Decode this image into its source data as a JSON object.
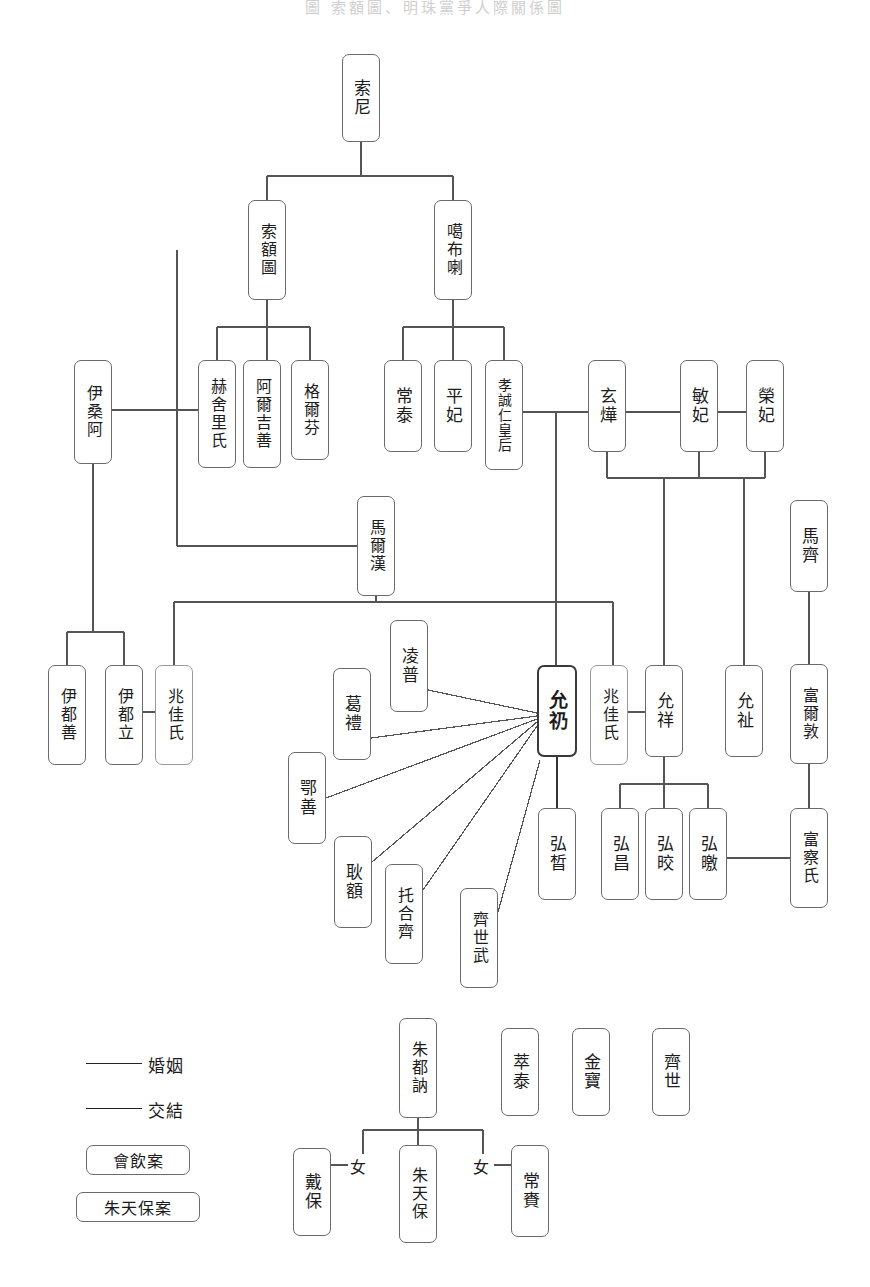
{
  "title": "圖  索額圖、明珠黨爭人際關係圖",
  "legend": {
    "lines": [
      {
        "key": "marriage",
        "label": "婚姻"
      },
      {
        "key": "association",
        "label": "交結"
      }
    ],
    "boxes": [
      {
        "key": "case-drinking",
        "label": "會飲案"
      },
      {
        "key": "case-zhutianbao",
        "label": "朱天保案"
      }
    ]
  },
  "relation_labels": {
    "daughter_left": "女",
    "daughter_right": "女"
  },
  "nodes": [
    {
      "id": "suoni",
      "label": "索尼",
      "x": 342,
      "y": 54,
      "w": 38,
      "h": 88,
      "style": "normal",
      "chars": 2
    },
    {
      "id": "suo-e-tu",
      "label": "索額圖",
      "x": 248,
      "y": 200,
      "w": 38,
      "h": 100,
      "style": "normal",
      "chars": 3
    },
    {
      "id": "gabula",
      "label": "噶布喇",
      "x": 434,
      "y": 200,
      "w": 38,
      "h": 100,
      "style": "normal",
      "chars": 3
    },
    {
      "id": "yisang-a",
      "label": "伊桑阿",
      "x": 74,
      "y": 360,
      "w": 38,
      "h": 104,
      "style": "normal",
      "chars": 3
    },
    {
      "id": "heshelishi",
      "label": "赫舍里氏",
      "x": 198,
      "y": 360,
      "w": 38,
      "h": 108,
      "style": "normal",
      "chars": 4
    },
    {
      "id": "aerjishan",
      "label": "阿爾吉善",
      "x": 243,
      "y": 360,
      "w": 38,
      "h": 108,
      "style": "normal",
      "chars": 4
    },
    {
      "id": "gerfen",
      "label": "格爾芬",
      "x": 291,
      "y": 360,
      "w": 38,
      "h": 100,
      "style": "normal",
      "chars": 3
    },
    {
      "id": "changtai",
      "label": "常泰",
      "x": 384,
      "y": 360,
      "w": 38,
      "h": 92,
      "style": "normal",
      "chars": 2
    },
    {
      "id": "pingfei",
      "label": "平妃",
      "x": 434,
      "y": 360,
      "w": 38,
      "h": 92,
      "style": "normal",
      "chars": 2
    },
    {
      "id": "xiaochengren",
      "label": "孝誠仁皇后",
      "x": 485,
      "y": 360,
      "w": 38,
      "h": 110,
      "style": "normal",
      "chars": 5
    },
    {
      "id": "xuanye",
      "label": "玄燁",
      "x": 588,
      "y": 360,
      "w": 38,
      "h": 92,
      "style": "normal",
      "chars": 2
    },
    {
      "id": "minfei",
      "label": "敏妃",
      "x": 680,
      "y": 360,
      "w": 38,
      "h": 92,
      "style": "normal",
      "chars": 2
    },
    {
      "id": "rongfei",
      "label": "榮妃",
      "x": 746,
      "y": 360,
      "w": 38,
      "h": 92,
      "style": "normal",
      "chars": 2
    },
    {
      "id": "maerhan",
      "label": "馬爾漢",
      "x": 357,
      "y": 496,
      "w": 38,
      "h": 100,
      "style": "normal",
      "chars": 3
    },
    {
      "id": "maqi",
      "label": "馬齊",
      "x": 790,
      "y": 500,
      "w": 38,
      "h": 92,
      "style": "normal",
      "chars": 2
    },
    {
      "id": "yidushan",
      "label": "伊都善",
      "x": 48,
      "y": 665,
      "w": 38,
      "h": 100,
      "style": "normal",
      "chars": 3
    },
    {
      "id": "yiduli",
      "label": "伊都立",
      "x": 105,
      "y": 665,
      "w": 38,
      "h": 100,
      "style": "normal",
      "chars": 3
    },
    {
      "id": "zhaojia-left",
      "label": "兆佳氏",
      "x": 155,
      "y": 665,
      "w": 38,
      "h": 100,
      "style": "light",
      "chars": 3
    },
    {
      "id": "lingpu",
      "label": "凌普",
      "x": 390,
      "y": 620,
      "w": 38,
      "h": 92,
      "style": "normal",
      "chars": 2
    },
    {
      "id": "geli",
      "label": "葛禮",
      "x": 333,
      "y": 668,
      "w": 38,
      "h": 92,
      "style": "normal",
      "chars": 2
    },
    {
      "id": "eshan",
      "label": "鄂善",
      "x": 288,
      "y": 752,
      "w": 38,
      "h": 92,
      "style": "normal",
      "chars": 2
    },
    {
      "id": "gen-e",
      "label": "耿額",
      "x": 334,
      "y": 836,
      "w": 38,
      "h": 92,
      "style": "normal",
      "chars": 2
    },
    {
      "id": "tuheqi",
      "label": "托合齊",
      "x": 385,
      "y": 864,
      "w": 38,
      "h": 100,
      "style": "normal",
      "chars": 3
    },
    {
      "id": "qishiwu",
      "label": "齊世武",
      "x": 460,
      "y": 888,
      "w": 38,
      "h": 100,
      "style": "normal",
      "chars": 3
    },
    {
      "id": "yunreng",
      "label": "允礽",
      "x": 537,
      "y": 665,
      "w": 40,
      "h": 92,
      "style": "bold",
      "chars": 2
    },
    {
      "id": "zhaojia-mid",
      "label": "兆佳氏",
      "x": 590,
      "y": 665,
      "w": 38,
      "h": 100,
      "style": "light",
      "chars": 3
    },
    {
      "id": "yunxiang",
      "label": "允祥",
      "x": 645,
      "y": 665,
      "w": 38,
      "h": 92,
      "style": "normal",
      "chars": 2
    },
    {
      "id": "yunzhi",
      "label": "允祉",
      "x": 725,
      "y": 665,
      "w": 38,
      "h": 92,
      "style": "normal",
      "chars": 2
    },
    {
      "id": "fuerdun",
      "label": "富爾敦",
      "x": 790,
      "y": 664,
      "w": 38,
      "h": 100,
      "style": "normal",
      "chars": 3
    },
    {
      "id": "hongxi",
      "label": "弘晳",
      "x": 538,
      "y": 808,
      "w": 38,
      "h": 92,
      "style": "normal",
      "chars": 2
    },
    {
      "id": "hongchang",
      "label": "弘昌",
      "x": 601,
      "y": 808,
      "w": 38,
      "h": 92,
      "style": "normal",
      "chars": 2
    },
    {
      "id": "hongjiao",
      "label": "弘晈",
      "x": 645,
      "y": 808,
      "w": 38,
      "h": 92,
      "style": "normal",
      "chars": 2
    },
    {
      "id": "hongxiao",
      "label": "弘曒",
      "x": 689,
      "y": 808,
      "w": 38,
      "h": 92,
      "style": "normal",
      "chars": 2
    },
    {
      "id": "fuchashi",
      "label": "富察氏",
      "x": 790,
      "y": 808,
      "w": 38,
      "h": 100,
      "style": "normal",
      "chars": 3
    },
    {
      "id": "zhudune",
      "label": "朱都訥",
      "x": 399,
      "y": 1018,
      "w": 38,
      "h": 100,
      "style": "normal",
      "chars": 3
    },
    {
      "id": "cuitai",
      "label": "萃泰",
      "x": 501,
      "y": 1028,
      "w": 38,
      "h": 88,
      "style": "normal",
      "chars": 2
    },
    {
      "id": "jinbao",
      "label": "金寶",
      "x": 572,
      "y": 1028,
      "w": 38,
      "h": 88,
      "style": "normal",
      "chars": 2
    },
    {
      "id": "qishi",
      "label": "齊世",
      "x": 652,
      "y": 1028,
      "w": 38,
      "h": 88,
      "style": "normal",
      "chars": 2
    },
    {
      "id": "daibao",
      "label": "戴保",
      "x": 293,
      "y": 1148,
      "w": 38,
      "h": 88,
      "style": "normal",
      "chars": 2
    },
    {
      "id": "zhutianbao",
      "label": "朱天保",
      "x": 399,
      "y": 1145,
      "w": 38,
      "h": 98,
      "style": "normal",
      "chars": 3
    },
    {
      "id": "changlai",
      "label": "常賚",
      "x": 511,
      "y": 1145,
      "w": 38,
      "h": 92,
      "style": "normal",
      "chars": 2
    }
  ]
}
